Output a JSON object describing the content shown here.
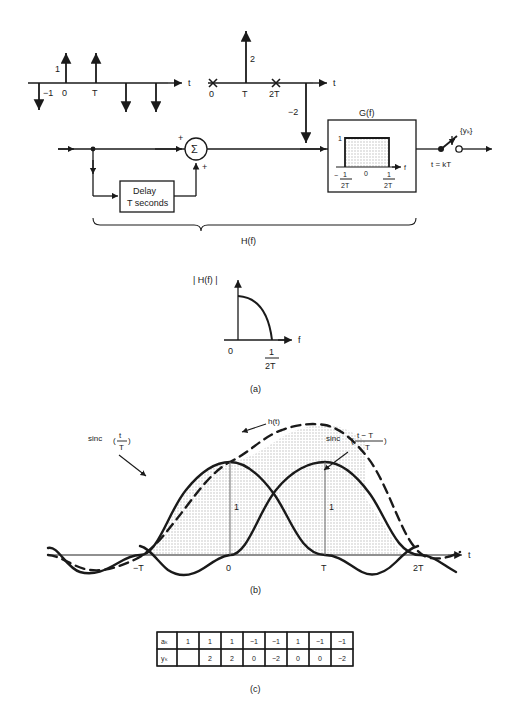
{
  "figure": {
    "title_parts": [
      "(a)",
      "(b)",
      "(c)"
    ],
    "background": "#ffffff",
    "ink": "#1a1a1a",
    "shade": "#e3e3e3"
  },
  "panel_a": {
    "caption": "(a)",
    "input_impulse_plot": {
      "axis_label": "t",
      "tick_labels": [
        "0",
        "T"
      ],
      "amplitude_labels": [
        "1",
        "−1"
      ],
      "impulses": [
        {
          "t": -1,
          "value": -1,
          "label": "−1"
        },
        {
          "t": 0,
          "value": 1,
          "label": "1"
        },
        {
          "t": 1,
          "value": 1,
          "label": ""
        },
        {
          "t": 2,
          "value": -1,
          "label": ""
        },
        {
          "t": 3,
          "value": -1,
          "label": ""
        }
      ]
    },
    "output_impulse_plot": {
      "axis_label": "t",
      "tick_labels": [
        "0",
        "T",
        "2T"
      ],
      "amplitude_labels": [
        "2",
        "−2"
      ],
      "impulses": [
        {
          "t": 0,
          "value": 0,
          "marker": "x"
        },
        {
          "t": 1,
          "value": 2,
          "label": "2"
        },
        {
          "t": 2,
          "value": 0,
          "marker": "x"
        },
        {
          "t": 3,
          "value": -2,
          "label": "−2"
        }
      ]
    },
    "block_diagram": {
      "summer_symbol": "Σ",
      "summer_sign_top": "+",
      "summer_sign_bottom": "+",
      "delay_block": {
        "line1": "Delay",
        "line2": "T seconds"
      },
      "filter_block": {
        "title": "G(f)",
        "amplitude_label": "1",
        "axis_label": "f",
        "tick_center": "0",
        "tick_left_sign": "−",
        "tick_left_num": "1",
        "tick_left_den": "2T",
        "tick_right_num": "1",
        "tick_right_den": "2T"
      },
      "sampler": {
        "label": "t = kT",
        "output_label": "{yₖ}"
      },
      "brace_label": "H(f)"
    },
    "magnitude_plot": {
      "y_label": "| H(f) |",
      "axis_label": "f",
      "tick_origin": "0",
      "tick_cutoff_num": "1",
      "tick_cutoff_den": "2T"
    }
  },
  "panel_b": {
    "caption": "(b)",
    "axis_label": "t",
    "tick_labels": [
      "−T",
      "0",
      "T",
      "2T"
    ],
    "height_labels": [
      "1",
      "1"
    ],
    "curve_labels": {
      "left_sinc": {
        "fn": "sinc",
        "num": "t",
        "den": "T"
      },
      "right_sinc": {
        "fn": "sinc",
        "num": "t − T",
        "den": "T"
      },
      "sum": "h(t)"
    }
  },
  "panel_c": {
    "caption": "(c)",
    "table": {
      "row_headers": [
        "aₖ",
        "yₖ"
      ],
      "rows": [
        [
          "1",
          "1",
          "1",
          "−1",
          "−1",
          "1",
          "−1",
          "−1"
        ],
        [
          "",
          "2",
          "2",
          "0",
          "−2",
          "0",
          "0",
          "−2"
        ]
      ]
    }
  }
}
